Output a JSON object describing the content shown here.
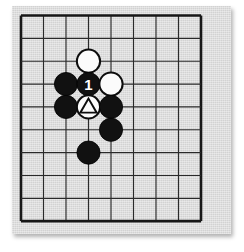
{
  "diagram": {
    "board": {
      "columns": 9,
      "rows": 10,
      "origin_x": 21,
      "origin_y": 15.5,
      "spacing_x": 22.5,
      "spacing_y": 22.85,
      "board_color": "#d9d9d9",
      "line_color": "#2a2a2a",
      "edge_line_color": "#171717",
      "page_color": "#ffffff"
    },
    "star_points": [
      {
        "name": "hoshi-center",
        "col": 3,
        "row": 6
      }
    ],
    "stones": [
      {
        "name": "white-stone-top",
        "color": "white",
        "col": 3,
        "row": 2,
        "label": "",
        "marker": "none"
      },
      {
        "name": "black-stone-left-upper",
        "color": "black",
        "col": 2,
        "row": 3,
        "label": "",
        "marker": "none"
      },
      {
        "name": "black-stone-move-1",
        "color": "black",
        "col": 3,
        "row": 3,
        "label": "1",
        "marker": "none"
      },
      {
        "name": "white-stone-right",
        "color": "white",
        "col": 4,
        "row": 3,
        "label": "",
        "marker": "none"
      },
      {
        "name": "black-stone-left-lower",
        "color": "black",
        "col": 2,
        "row": 4,
        "label": "",
        "marker": "none"
      },
      {
        "name": "white-stone-marked",
        "color": "white",
        "col": 3,
        "row": 4,
        "label": "",
        "marker": "triangle"
      },
      {
        "name": "black-stone-right-mid",
        "color": "black",
        "col": 4,
        "row": 4,
        "label": "",
        "marker": "none"
      },
      {
        "name": "black-stone-right-low",
        "color": "black",
        "col": 4,
        "row": 5,
        "label": "",
        "marker": "none"
      },
      {
        "name": "black-stone-bottom",
        "color": "black",
        "col": 3,
        "row": 6,
        "label": "",
        "marker": "none"
      }
    ],
    "stone_radius": 11.6,
    "star_point_radius": 2.6,
    "move_numbers": [
      "1"
    ],
    "markers": [
      "triangle"
    ]
  }
}
